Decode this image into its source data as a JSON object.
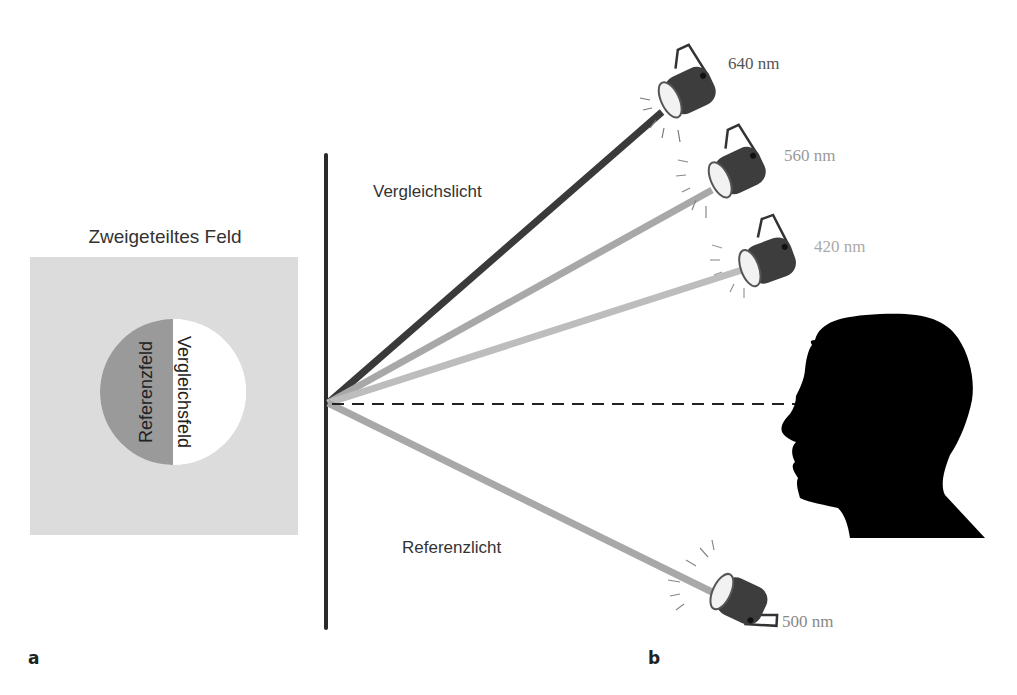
{
  "panel_a": {
    "letter": "a",
    "title": "Zweigeteiltes Feld",
    "left_half_label": "Referenzfeld",
    "right_half_label": "Vergleichsfeld",
    "colors": {
      "background": "#dcdcdc",
      "reference_half": "#9a9a9a",
      "comparison_half": "#ffffff"
    }
  },
  "panel_b": {
    "letter": "b",
    "comparison_light_label": "Vergleichslicht",
    "reference_light_label": "Referenzlicht",
    "lamps": [
      {
        "wavelength": "640 nm",
        "role": "comparison",
        "beam_color": "#3a3a3a",
        "label_color": "#555555"
      },
      {
        "wavelength": "560 nm",
        "role": "comparison",
        "beam_color": "#a8a8a8",
        "label_color": "#9a9a9a"
      },
      {
        "wavelength": "420 nm",
        "role": "comparison",
        "beam_color": "#bdbdbd",
        "label_color": "#aaaaaa"
      },
      {
        "wavelength": "500 nm",
        "role": "reference",
        "beam_color": "#a8a8a8",
        "label_color": "#888888"
      }
    ]
  }
}
